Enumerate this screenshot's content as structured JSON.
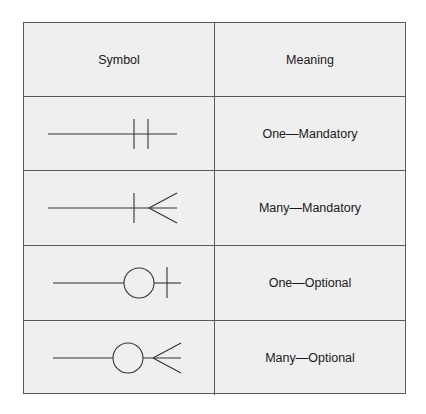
{
  "table": {
    "headers": {
      "symbol": "Symbol",
      "meaning": "Meaning"
    },
    "rows": [
      {
        "symbol_icon": "one-mandatory-icon",
        "meaning": "One—Mandatory"
      },
      {
        "symbol_icon": "many-mandatory-icon",
        "meaning": "Many—Mandatory"
      },
      {
        "symbol_icon": "one-optional-icon",
        "meaning": "One—Optional"
      },
      {
        "symbol_icon": "many-optional-icon",
        "meaning": "Many—Optional"
      }
    ]
  },
  "colors": {
    "background": "#efefef",
    "border": "#5a5a5a",
    "stroke": "#333333"
  }
}
